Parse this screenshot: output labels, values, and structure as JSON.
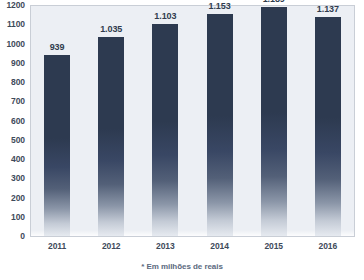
{
  "chart_data": {
    "type": "bar",
    "title": "",
    "subtitle": "",
    "xlabel": "",
    "ylabel": "",
    "categories": [
      "2011",
      "2012",
      "2013",
      "2014",
      "2015",
      "2016"
    ],
    "values": [
      939,
      1035,
      1103,
      1153,
      1189,
      1137
    ],
    "value_labels": [
      "939",
      "1.035",
      "1.103",
      "1.153",
      "1.189",
      "1.137"
    ],
    "ylim": [
      0,
      1200
    ],
    "ytick_step": 100,
    "ytick_labels": [
      "1200",
      "1100",
      "1000",
      "900",
      "800",
      "700",
      "600",
      "500",
      "400",
      "300",
      "200",
      "100",
      "0"
    ],
    "ytick_values": [
      1200,
      1100,
      1000,
      900,
      800,
      700,
      600,
      500,
      400,
      300,
      200,
      100,
      0
    ],
    "grid": false,
    "legend": null,
    "legend_position": "none",
    "annotations": [
      "* Em milhões de reais"
    ],
    "footnote": "* Em milhões de reais",
    "series": [
      {
        "name": "",
        "values": [
          939,
          1035,
          1103,
          1153,
          1189,
          1137
        ]
      }
    ],
    "colors": {
      "bar_top": "#2d3a50",
      "bar_bottom": "#e6eaf0",
      "plot_background": "#eceff4",
      "plot_border": "#c9ced6",
      "axis_text": "#3e4a5a",
      "label_text": "#303c4e",
      "footnote_text": "#5b6a80",
      "page_background": "#ffffff"
    }
  }
}
